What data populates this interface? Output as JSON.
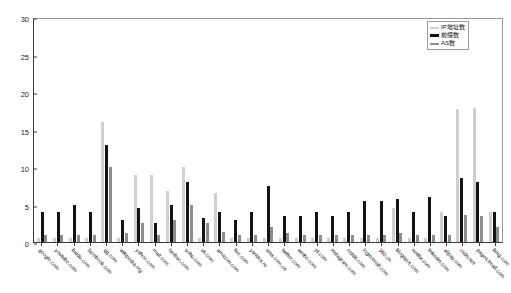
{
  "chart_data": {
    "type": "bar",
    "title": "",
    "xlabel": "",
    "ylabel": "",
    "ylim": [
      0,
      30
    ],
    "yticks": [
      0,
      5,
      10,
      15,
      20,
      25,
      30
    ],
    "grid": false,
    "legend_position": "top-right",
    "categories": [
      "google.com",
      "youtube.com",
      "baidu.com",
      "facebook.com",
      "qq.com",
      "wikipedia.org",
      "yahoo.com",
      "mail.com",
      "taobao.com",
      "sohu.com",
      "vk.com",
      "amazon.com",
      "live.com",
      "yandex.ru",
      "sina.com.cn",
      "twitter.com",
      "weibo.com",
      "jd.com",
      "instagram.com",
      "reddit.com",
      "login.tmall.com",
      "360.cn",
      "blogspot.com",
      "netflix.com",
      "linkedin.com",
      "alipay.com",
      "csdn.net",
      "pages.tmall.com",
      "bing.com"
    ],
    "series": [
      {
        "name": "IP地址数",
        "color": "#cfcfcf",
        "values": [
          0.6,
          0.6,
          0.6,
          0.6,
          16.0,
          0.6,
          9.0,
          9.0,
          6.8,
          10.0,
          0.6,
          6.5,
          0.6,
          0.6,
          0.6,
          0.6,
          0.6,
          0.6,
          0.6,
          0.6,
          0.6,
          0.6,
          4.6,
          0.6,
          0.6,
          4.0,
          17.8,
          17.9,
          4.0
        ]
      },
      {
        "name": "前缀数",
        "color": "#131313",
        "values": [
          4.0,
          4.0,
          5.0,
          4.0,
          13.0,
          3.0,
          4.5,
          2.5,
          5.0,
          8.0,
          3.2,
          4.0,
          3.0,
          4.0,
          7.5,
          3.5,
          3.5,
          4.0,
          3.5,
          4.0,
          5.5,
          5.5,
          5.8,
          4.0,
          6.0,
          3.5,
          8.6,
          8.0,
          4.0
        ]
      },
      {
        "name": "AS数",
        "color": "#8d8d8d",
        "values": [
          1.0,
          1.0,
          1.0,
          1.0,
          10.0,
          1.2,
          2.5,
          1.0,
          3.0,
          5.0,
          2.5,
          1.4,
          1.0,
          1.0,
          2.0,
          1.2,
          1.0,
          1.0,
          1.0,
          1.0,
          1.0,
          1.0,
          1.2,
          1.0,
          1.0,
          1.0,
          3.6,
          3.5,
          2.0
        ]
      }
    ]
  }
}
